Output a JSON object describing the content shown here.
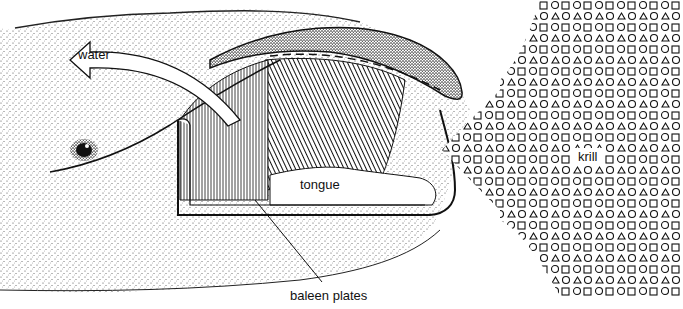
{
  "figure": {
    "labels": {
      "water": "water",
      "tongue": "tongue",
      "baleen_plates": "baleen plates",
      "krill": "krill"
    },
    "colors": {
      "ink": "#111111",
      "background": "#ffffff",
      "stipple": "#444444"
    }
  }
}
